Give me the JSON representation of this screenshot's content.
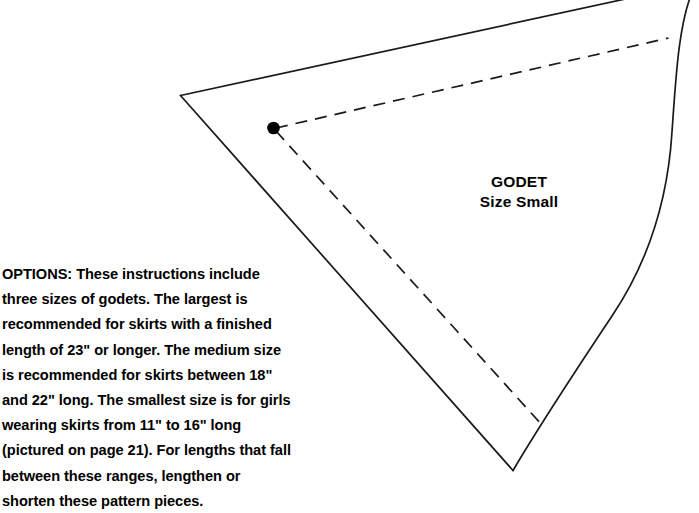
{
  "page": {
    "background_color": "#ffffff",
    "ink_color": "#1a1a1a",
    "width": 699,
    "height": 486
  },
  "pattern_piece": {
    "name": "GODET",
    "size": "Size Small",
    "outline_color": "#1a1a1a",
    "stitch_line_style": "dashed",
    "marking_dot_color": "#000000"
  },
  "instructions": {
    "options_text": "OPTIONS: These instructions include three sizes of godets. The largest is recommended for skirts with a finished length of 23\" or longer. The medium size is recommended for skirts between 18\" and 22\" long. The smallest size is for girls wearing skirts from 11\" to 16\" long (pictured on page 21). For lengths that fall between these ranges, lengthen or shorten these pattern pieces."
  }
}
